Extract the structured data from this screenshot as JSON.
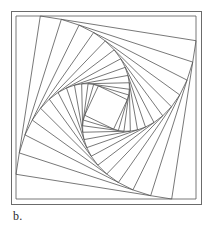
{
  "figure": {
    "label": "b.",
    "caption_position": "bottom-left",
    "stroke_color": "#555555",
    "frame_color": "#6b6b6b",
    "background_color": "#ffffff",
    "stroke_width": 0.8,
    "frame": {
      "x": 11,
      "y": 11,
      "width": 190,
      "height": 193
    },
    "spiral": {
      "turns": 13,
      "ratio": 0.135,
      "outer_polygon": [
        {
          "x": 16,
          "y": 16
        },
        {
          "x": 196,
          "y": 16
        },
        {
          "x": 196,
          "y": 199
        },
        {
          "x": 16,
          "y": 199
        }
      ]
    },
    "construction_lines": {
      "left_verticals": 6,
      "top_horizontals": 6,
      "right_diagonals": 6,
      "bottom_diagonals": 6
    }
  }
}
